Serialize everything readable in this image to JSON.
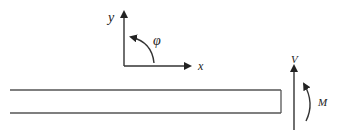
{
  "diagram": {
    "type": "beam free-body diagram",
    "axes": {
      "y_label": "y",
      "x_label": "x",
      "angle_label": "φ"
    },
    "end_loads": {
      "shear_label": "V",
      "moment_label": "M"
    },
    "colors": {
      "stroke": "#333333",
      "background": "#ffffff"
    }
  }
}
